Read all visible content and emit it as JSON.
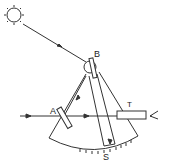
{
  "diagram": {
    "labels": {
      "mirror_b": "B",
      "mirror_a": "A",
      "telescope": "T",
      "scale": "S"
    },
    "icons": {
      "sun": "sun-icon",
      "eye": "eye-icon"
    },
    "colors": {
      "line": "#333333",
      "background": "#ffffff"
    }
  }
}
